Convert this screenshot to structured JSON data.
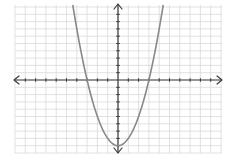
{
  "chart_data": {
    "type": "line",
    "title": "",
    "xlabel": "",
    "ylabel": "",
    "function": "y = x^2 - 9",
    "xlim": [
      -10,
      10
    ],
    "ylim": [
      -10,
      10
    ],
    "grid": true,
    "axes_arrows": true,
    "tick_step": 1,
    "series": [
      {
        "name": "parabola",
        "vertex": [
          0,
          -9
        ],
        "x_intercepts": [
          -3,
          3
        ],
        "points": [
          [
            -4.4,
            10.36
          ],
          [
            -4,
            7
          ],
          [
            -3,
            0
          ],
          [
            -2,
            -5
          ],
          [
            -1,
            -8
          ],
          [
            0,
            -9
          ],
          [
            1,
            -8
          ],
          [
            2,
            -5
          ],
          [
            3,
            0
          ],
          [
            4,
            7
          ],
          [
            4.4,
            10.36
          ]
        ]
      }
    ]
  },
  "colors": {
    "grid": "#d9d9d9",
    "axis": "#3a3a3a",
    "curve": "#888888",
    "background": "#ffffff"
  }
}
